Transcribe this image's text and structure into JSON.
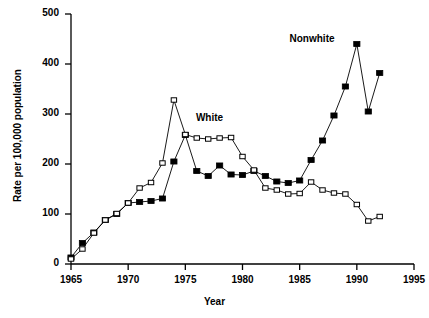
{
  "chart_data": {
    "type": "line",
    "title": "",
    "xlabel": "Year",
    "ylabel": "Rate per 100,000 population",
    "xlim": [
      1964,
      1995
    ],
    "ylim": [
      0,
      500
    ],
    "xticks": [
      1965,
      1970,
      1975,
      1980,
      1985,
      1990,
      1995
    ],
    "yticks": [
      0,
      100,
      200,
      300,
      400,
      500
    ],
    "grid": false,
    "legend_position": "inline-annotations",
    "annotations": [
      {
        "text": "White",
        "x": 1977.5,
        "y": 290
      },
      {
        "text": "Nonwhite",
        "x": 1987.0,
        "y": 448
      }
    ],
    "series": [
      {
        "name": "Nonwhite",
        "marker": "filled-square",
        "color": "#000000",
        "x": [
          1965,
          1966,
          1967,
          1968,
          1969,
          1970,
          1971,
          1972,
          1973,
          1974,
          1975,
          1976,
          1977,
          1978,
          1979,
          1980,
          1981,
          1982,
          1983,
          1984,
          1985,
          1986,
          1987,
          1988,
          1989,
          1990,
          1991,
          1992
        ],
        "values": [
          13,
          42,
          63,
          88,
          100,
          122,
          124,
          126,
          131,
          205,
          258,
          186,
          176,
          197,
          179,
          178,
          186,
          176,
          165,
          162,
          167,
          208,
          247,
          297,
          355,
          440,
          305,
          382
        ]
      },
      {
        "name": "White",
        "marker": "open-square",
        "color": "#000000",
        "x": [
          1965,
          1966,
          1967,
          1968,
          1969,
          1970,
          1971,
          1972,
          1973,
          1974,
          1975,
          1976,
          1977,
          1978,
          1979,
          1980,
          1981,
          1982,
          1983,
          1984,
          1985,
          1986,
          1987,
          1988,
          1989,
          1990,
          1991,
          1992
        ],
        "values": [
          10,
          30,
          62,
          88,
          101,
          122,
          152,
          163,
          202,
          328,
          259,
          252,
          250,
          252,
          253,
          215,
          188,
          152,
          148,
          140,
          141,
          164,
          148,
          142,
          140,
          119,
          86,
          95
        ]
      }
    ]
  },
  "axis": {
    "y_title": "Rate per 100,000 population",
    "x_title": "Year",
    "y_tick_labels": [
      "500",
      "400",
      "300",
      "200",
      "100",
      "0"
    ],
    "x_tick_labels": [
      "1965",
      "1970",
      "1975",
      "1980",
      "1985",
      "1990",
      "1995"
    ]
  },
  "labels": {
    "white": "White",
    "nonwhite": "Nonwhite"
  }
}
